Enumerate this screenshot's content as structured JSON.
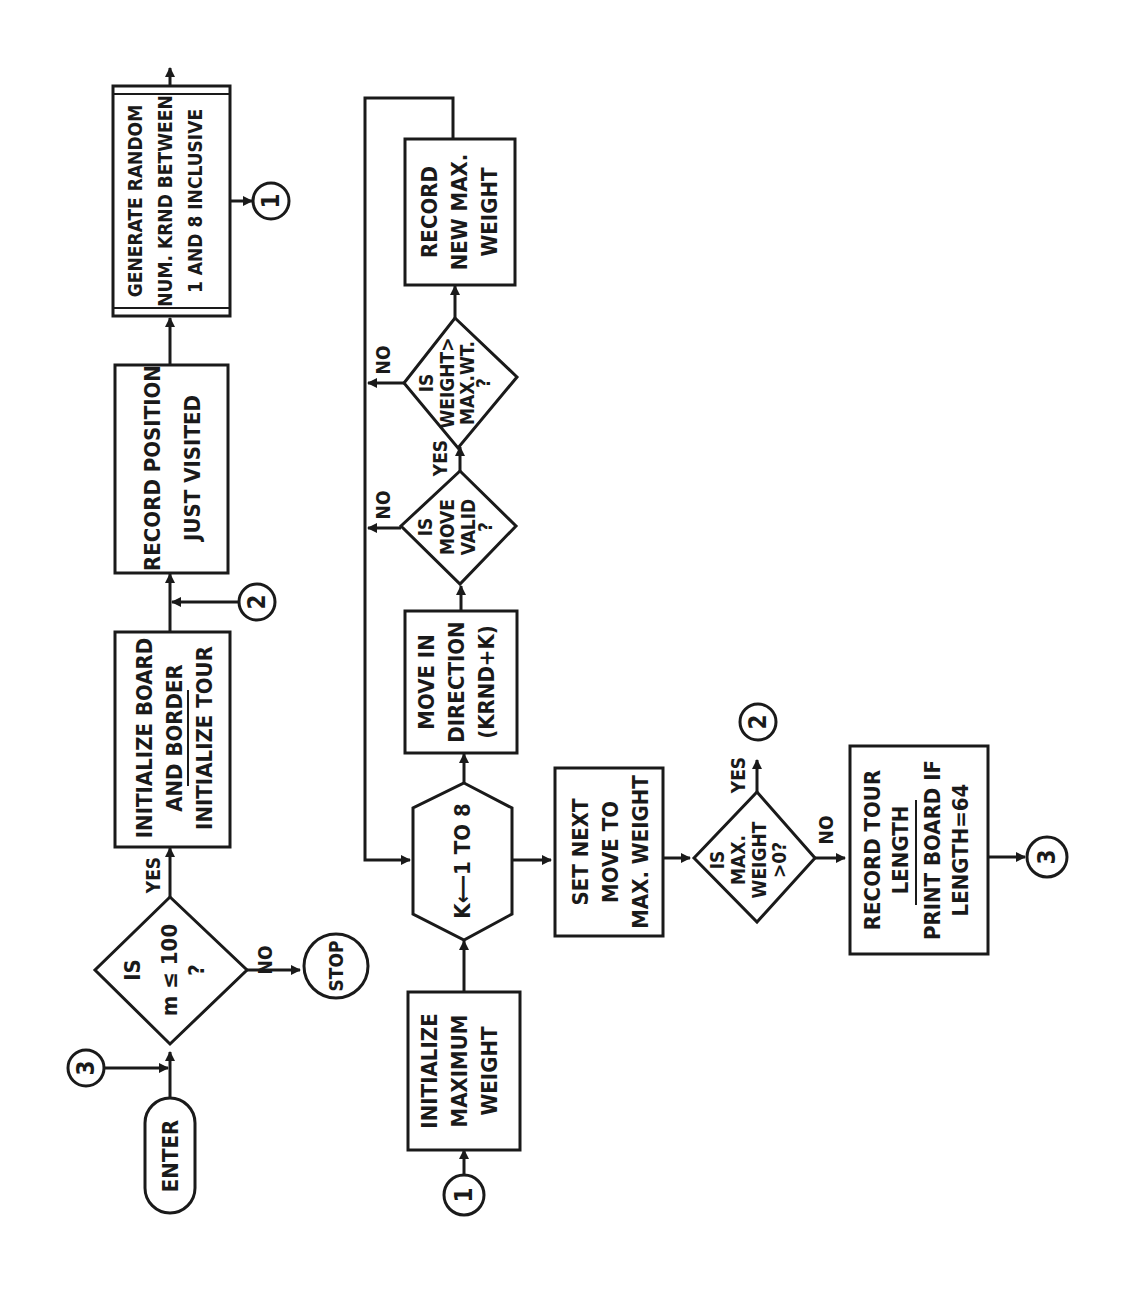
{
  "diagram": {
    "type": "flowchart",
    "orientation": "rotated 90 degrees counter-clockwise (flow reads upward)",
    "colors": {
      "ink": "#1a1a1a",
      "paper": "#ffffff"
    },
    "nodes": {
      "enter": {
        "shape": "terminal",
        "label": "ENTER"
      },
      "decision_m": {
        "shape": "decision",
        "lines": [
          "IS",
          "m ≤ 100",
          "?"
        ]
      },
      "stop": {
        "shape": "terminal-circle",
        "label": "STOP"
      },
      "init_board": {
        "shape": "process",
        "lines": [
          "INITIALIZE BOARD",
          "AND BORDER",
          "INITIALIZE TOUR"
        ]
      },
      "record_position": {
        "shape": "process",
        "lines": [
          "RECORD POSITION",
          "JUST VISITED"
        ]
      },
      "generate_random": {
        "shape": "predefined-process",
        "lines": [
          "GENERATE RANDOM",
          "NUM. KRND BETWEEN",
          "1 AND 8 INCLUSIVE"
        ]
      },
      "init_max_weight": {
        "shape": "process",
        "lines": [
          "INITIALIZE",
          "MAXIMUM",
          "WEIGHT"
        ]
      },
      "loop_k": {
        "shape": "preparation",
        "label": "K⟵1 TO 8"
      },
      "move_direction": {
        "shape": "process",
        "lines": [
          "MOVE IN",
          "DIRECTION",
          "(KRND+K)"
        ]
      },
      "decision_valid": {
        "shape": "decision",
        "lines": [
          "IS",
          "MOVE",
          "VALID",
          "?"
        ]
      },
      "decision_weight": {
        "shape": "decision",
        "lines": [
          "IS",
          "WEIGHT>",
          "MAX.WT.",
          "?"
        ]
      },
      "record_max": {
        "shape": "process",
        "lines": [
          "RECORD",
          "NEW MAX.",
          "WEIGHT"
        ]
      },
      "set_next_move": {
        "shape": "process",
        "lines": [
          "SET NEXT",
          "MOVE TO",
          "MAX. WEIGHT"
        ]
      },
      "decision_maxw": {
        "shape": "decision",
        "lines": [
          "IS",
          "MAX.",
          "WEIGHT",
          ">0?"
        ]
      },
      "record_tour": {
        "shape": "process",
        "lines": [
          "RECORD TOUR",
          "LENGTH",
          "PRINT BOARD IF",
          "LENGTH=64"
        ]
      }
    },
    "connectors": {
      "c1_out": "1",
      "c1_in": "1",
      "c2_out": "2",
      "c2_in": "2",
      "c3_out": "3",
      "c3_in": "3"
    },
    "edge_labels": {
      "m_yes": "YES",
      "m_no": "NO",
      "valid_yes": "YES",
      "valid_no": "NO",
      "weight_no": "NO",
      "maxw_yes": "YES",
      "maxw_no": "NO"
    }
  }
}
